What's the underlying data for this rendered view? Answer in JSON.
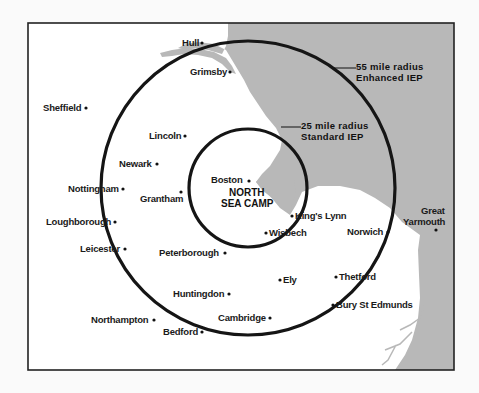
{
  "map": {
    "colors": {
      "land": "#ffffff",
      "sea": "#b8b8b8",
      "frame": "#222222",
      "rings": "#151515",
      "background": "#fafafa"
    },
    "center": {
      "name": "NORTH SEA CAMP",
      "line1": "NORTH",
      "line2": "SEA CAMP"
    },
    "rings": [
      {
        "id": "inner",
        "radius_miles": 25,
        "line1": "25 mile radius",
        "line2": "Standard IEP"
      },
      {
        "id": "outer",
        "radius_miles": 55,
        "line1": "55 mile radius",
        "line2": "Enhanced IEP"
      }
    ],
    "towns": [
      {
        "name": "Hull"
      },
      {
        "name": "Grimsby"
      },
      {
        "name": "Sheffield"
      },
      {
        "name": "Lincoln"
      },
      {
        "name": "Newark"
      },
      {
        "name": "Nottingham"
      },
      {
        "name": "Grantham"
      },
      {
        "name": "Boston"
      },
      {
        "name": "Loughborough"
      },
      {
        "name": "Leicester"
      },
      {
        "name": "King's Lynn"
      },
      {
        "name": "Wisbech"
      },
      {
        "name": "Norwich"
      },
      {
        "name": "Peterborough"
      },
      {
        "name": "Ely"
      },
      {
        "name": "Thetford"
      },
      {
        "name": "Huntingdon"
      },
      {
        "name": "Bury St Edmunds"
      },
      {
        "name": "Northampton"
      },
      {
        "name": "Cambridge"
      },
      {
        "name": "Bedford"
      },
      {
        "name": "Great Yarmouth",
        "line1": "Great",
        "line2": "Yarmouth"
      }
    ]
  }
}
